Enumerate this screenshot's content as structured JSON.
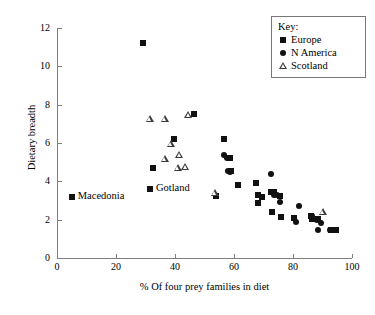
{
  "chart_data": {
    "type": "scatter",
    "title": "",
    "xlabel": "% Of four prey families in diet",
    "ylabel": "Dietary breadth",
    "xlim": [
      0,
      100
    ],
    "ylim": [
      0,
      12
    ],
    "xticks": [
      0,
      20,
      40,
      60,
      80,
      100
    ],
    "yticks": [
      0,
      2,
      4,
      6,
      8,
      10,
      12
    ],
    "grid": false,
    "legend_position": "top-right",
    "legend_title": "Key:",
    "series": [
      {
        "name": "Europe",
        "marker": "filled-square",
        "color": "#111111",
        "points": [
          [
            5.0,
            3.2
          ],
          [
            29.0,
            11.2
          ],
          [
            32.5,
            4.7
          ],
          [
            31.5,
            3.6
          ],
          [
            39.5,
            6.2
          ],
          [
            46.5,
            7.5
          ],
          [
            53.8,
            3.25
          ],
          [
            56.5,
            6.2
          ],
          [
            58.5,
            5.2
          ],
          [
            59.0,
            4.55
          ],
          [
            61.5,
            3.8
          ],
          [
            67.5,
            3.9
          ],
          [
            68.0,
            3.3
          ],
          [
            68.0,
            2.85
          ],
          [
            69.5,
            3.2
          ],
          [
            72.5,
            3.45
          ],
          [
            73.5,
            3.45
          ],
          [
            73.0,
            2.4
          ],
          [
            75.5,
            3.25
          ],
          [
            76.0,
            2.15
          ],
          [
            80.5,
            2.1
          ],
          [
            86.0,
            2.2
          ],
          [
            86.5,
            2.05
          ],
          [
            88.5,
            2.05
          ],
          [
            93.0,
            1.45
          ],
          [
            94.5,
            1.45
          ]
        ]
      },
      {
        "name": "N America",
        "marker": "filled-circle",
        "color": "#111111",
        "points": [
          [
            56.5,
            5.35
          ],
          [
            57.5,
            5.2
          ],
          [
            58.0,
            4.55
          ],
          [
            58.5,
            4.5
          ],
          [
            72.5,
            4.4
          ],
          [
            73.5,
            3.3
          ],
          [
            74.5,
            3.3
          ],
          [
            75.5,
            2.9
          ],
          [
            82.0,
            2.7
          ],
          [
            81.0,
            1.9
          ],
          [
            86.5,
            2.2
          ],
          [
            88.0,
            2.0
          ],
          [
            89.5,
            1.85
          ],
          [
            88.5,
            1.45
          ],
          [
            92.5,
            1.45
          ],
          [
            94.5,
            1.45
          ]
        ]
      },
      {
        "name": "Scotland",
        "marker": "open-triangle",
        "color": "#3a3a3a",
        "points": [
          [
            31.5,
            7.25
          ],
          [
            36.5,
            7.25
          ],
          [
            44.5,
            7.45
          ],
          [
            36.5,
            5.15
          ],
          [
            38.5,
            5.95
          ],
          [
            41.5,
            5.4
          ],
          [
            41.0,
            4.7
          ],
          [
            43.5,
            4.75
          ],
          [
            53.5,
            3.4
          ],
          [
            90.0,
            2.4
          ]
        ]
      }
    ],
    "annotations": [
      {
        "text": "Macedonia",
        "x": 5.0,
        "y": 3.2
      },
      {
        "text": "Gotland",
        "x": 31.5,
        "y": 3.6
      }
    ]
  }
}
